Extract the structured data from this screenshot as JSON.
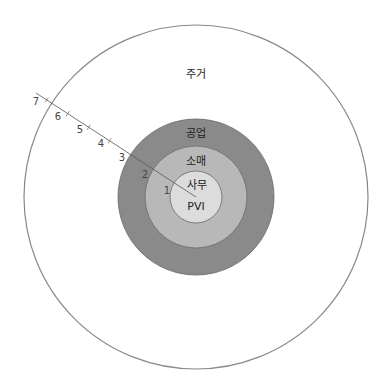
{
  "diagram": {
    "type": "concentric-zones",
    "center": [
      196,
      197
    ],
    "zones": [
      {
        "id": "residential",
        "label": "주거",
        "radius": 172,
        "fill": "#ffffff",
        "stroke": "#888888",
        "label_pos": [
          196,
          75
        ]
      },
      {
        "id": "industrial",
        "label": "공업",
        "radius": 78,
        "fill": "#8a8a8a",
        "stroke": "#6a6a6a",
        "label_pos": [
          196,
          134
        ]
      },
      {
        "id": "retail",
        "label": "소매",
        "radius": 51,
        "fill": "#b8b8b8",
        "stroke": "#6a6a6a",
        "label_pos": [
          196,
          162
        ]
      },
      {
        "id": "office",
        "label": "사무",
        "radius": 26,
        "fill": "#dcdcdc",
        "stroke": "#6a6a6a",
        "label_pos": [
          197,
          186
        ]
      },
      {
        "id": "pvi",
        "label": "PVI",
        "radius": 0,
        "label_pos": [
          196,
          207
        ]
      }
    ],
    "scale_line": {
      "start": [
        36,
        93
      ],
      "end": [
        196,
        197
      ],
      "color": "#999999"
    },
    "ticks": [
      {
        "label": "1",
        "radius": 26,
        "tick": false,
        "label_pos": [
          167,
          191
        ]
      },
      {
        "label": "2",
        "radius": 51,
        "tick": false,
        "label_pos": [
          145,
          175
        ]
      },
      {
        "label": "3",
        "radius": 78,
        "tick": false,
        "label_pos": [
          122,
          158
        ]
      },
      {
        "label": "4",
        "radius": 103,
        "tick": true,
        "tick_pos": [
          110,
          141
        ],
        "label_pos": [
          101,
          144
        ]
      },
      {
        "label": "5",
        "radius": 128,
        "tick": true,
        "tick_pos": [
          89,
          127
        ],
        "label_pos": [
          80,
          130
        ]
      },
      {
        "label": "6",
        "radius": 153,
        "tick": true,
        "tick_pos": [
          68,
          114
        ],
        "label_pos": [
          58,
          117
        ]
      },
      {
        "label": "7",
        "radius": 178,
        "tick": true,
        "tick_pos": [
          47,
          100
        ],
        "label_pos": [
          36,
          102
        ]
      }
    ]
  }
}
